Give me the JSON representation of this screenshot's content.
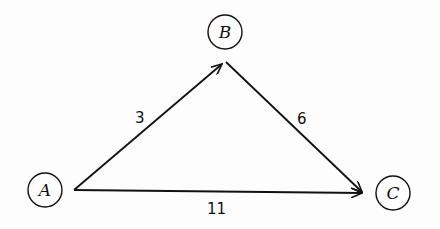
{
  "diagram": {
    "type": "directed-weighted-graph",
    "nodes": [
      {
        "id": "A",
        "label": "A",
        "cx": 45,
        "cy": 190
      },
      {
        "id": "B",
        "label": "B",
        "cx": 225,
        "cy": 32
      },
      {
        "id": "C",
        "label": "C",
        "cx": 393,
        "cy": 193
      }
    ],
    "edges": [
      {
        "from": "A",
        "to": "B",
        "weight": "3"
      },
      {
        "from": "B",
        "to": "C",
        "weight": "6"
      },
      {
        "from": "A",
        "to": "C",
        "weight": "11"
      }
    ]
  }
}
